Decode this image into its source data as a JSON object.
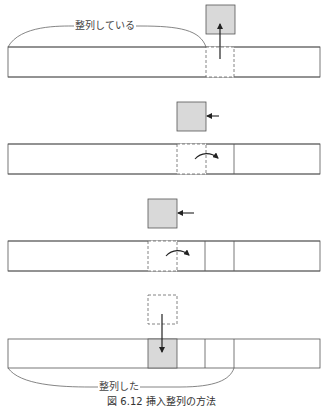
{
  "figure": {
    "labels": {
      "top_brace": "整列している",
      "bottom_brace": "整列した"
    },
    "caption": "図 6.12 挿入整列の方法",
    "colors": {
      "stroke": "#555555",
      "fill_gray": "#d9d9d9",
      "background": "#ffffff"
    },
    "steps": [
      {
        "step": 1,
        "description": "Element lifted out of array (arrow up)"
      },
      {
        "step": 2,
        "description": "Element moved left, larger element shifted right"
      },
      {
        "step": 3,
        "description": "Element moved left again, next element shifted right"
      },
      {
        "step": 4,
        "description": "Element inserted into vacated slot (arrow down)"
      }
    ]
  }
}
